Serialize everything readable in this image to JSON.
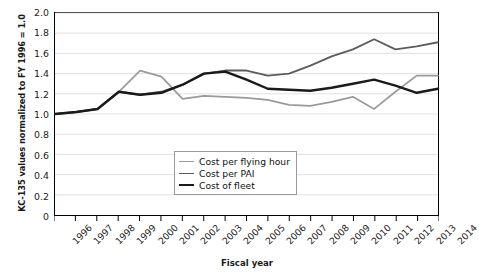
{
  "chart_data": {
    "type": "line",
    "title": "",
    "xlabel": "Fiscal year",
    "ylabel": "KC-135 values normalized to FY 1996 = 1.0",
    "x": [
      1996,
      1997,
      1998,
      1999,
      2000,
      2001,
      2002,
      2003,
      2004,
      2005,
      2006,
      2007,
      2008,
      2009,
      2010,
      2011,
      2012,
      2013,
      2014
    ],
    "categories": [
      "1996",
      "1997",
      "1998",
      "1999",
      "2000",
      "2001",
      "2002",
      "2003",
      "2004",
      "2005",
      "2006",
      "2007",
      "2008",
      "2009",
      "2010",
      "2011",
      "2012",
      "2013",
      "2014"
    ],
    "xlim": [
      1996,
      2014
    ],
    "ylim": [
      0,
      2.0
    ],
    "ytick_labels": [
      "0",
      "0.2",
      "0.4",
      "0.6",
      "0.8",
      "1.0",
      "1.2",
      "1.4",
      "1.6",
      "1.8",
      "2.0"
    ],
    "ytick_values": [
      0,
      0.2,
      0.4,
      0.6,
      0.8,
      1.0,
      1.2,
      1.4,
      1.6,
      1.8,
      2.0
    ],
    "grid": true,
    "grid_axis": "y",
    "legend_position": "inside-center-lower",
    "series": [
      {
        "name": "Cost per flying hour",
        "color": "#9a9a9a",
        "width": 1.7,
        "values": [
          1.0,
          1.02,
          1.05,
          1.22,
          1.43,
          1.37,
          1.15,
          1.18,
          1.17,
          1.16,
          1.14,
          1.09,
          1.08,
          1.12,
          1.17,
          1.05,
          1.22,
          1.38,
          1.38
        ]
      },
      {
        "name": "Cost per PAI",
        "color": "#5c5c5c",
        "width": 1.9,
        "values": [
          1.0,
          1.02,
          1.05,
          1.22,
          1.19,
          1.22,
          1.29,
          1.4,
          1.43,
          1.43,
          1.38,
          1.4,
          1.48,
          1.57,
          1.64,
          1.74,
          1.64,
          1.67,
          1.71
        ]
      },
      {
        "name": "Cost of fleet",
        "color": "#1a1a1a",
        "width": 2.4,
        "values": [
          1.0,
          1.02,
          1.05,
          1.22,
          1.19,
          1.21,
          1.29,
          1.4,
          1.42,
          1.34,
          1.25,
          1.24,
          1.23,
          1.26,
          1.3,
          1.34,
          1.28,
          1.21,
          1.25
        ]
      }
    ]
  },
  "axes": {
    "y_title": "KC-135 values normalized to FY 1996 = 1.0",
    "x_title": "Fiscal year"
  },
  "legend": {
    "items": [
      {
        "label": "Cost per flying hour"
      },
      {
        "label": "Cost per PAI"
      },
      {
        "label": "Cost of fleet"
      }
    ]
  }
}
